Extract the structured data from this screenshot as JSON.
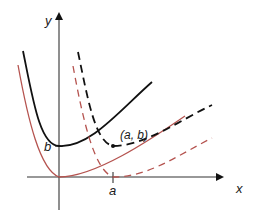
{
  "diagram": {
    "axes": {
      "x_label": "x",
      "y_label": "y"
    },
    "labels": {
      "b": "b",
      "a": "a",
      "point": "(a, b)"
    },
    "colors": {
      "black_curve": "#111111",
      "red_curve": "#b5534f",
      "axis": "#333333"
    },
    "curves": [
      {
        "name": "original",
        "color": "red",
        "style": "solid",
        "vertex": "origin"
      },
      {
        "name": "shifted-up-b",
        "color": "black",
        "style": "solid",
        "vertex": "(0, b)"
      },
      {
        "name": "shifted-right-a",
        "color": "red",
        "style": "dashed",
        "vertex": "(a, 0)"
      },
      {
        "name": "shifted-a-b",
        "color": "black",
        "style": "dashed",
        "vertex": "(a, b)"
      }
    ]
  }
}
